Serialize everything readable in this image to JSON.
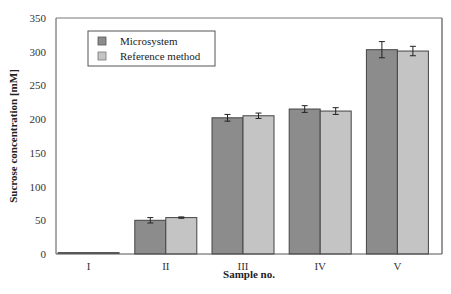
{
  "chart_data": {
    "type": "bar",
    "title": "",
    "xlabel": "Sample no.",
    "ylabel": "Sucrose concentration [mM]",
    "ylim": [
      0,
      350
    ],
    "yticks": [
      0,
      50,
      100,
      150,
      200,
      250,
      300,
      350
    ],
    "categories": [
      "I",
      "II",
      "III",
      "IV",
      "V"
    ],
    "grid": false,
    "legend_position": "upper-left-inside",
    "series": [
      {
        "name": "Microsystem",
        "color": "#8c8c8c",
        "values": [
          0,
          50,
          202,
          215,
          303
        ],
        "errors": [
          0,
          4,
          5,
          5,
          12
        ]
      },
      {
        "name": "Reference method",
        "color": "#c4c4c4",
        "values": [
          0,
          54,
          205,
          212,
          301
        ],
        "errors": [
          0,
          1,
          4,
          5,
          7
        ]
      }
    ]
  }
}
